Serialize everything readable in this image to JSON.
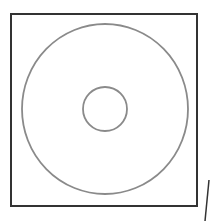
{
  "diagram": {
    "colors": {
      "square_stroke": "#333333",
      "circle_stroke": "#8a8a8a",
      "background": "#ffffff"
    },
    "square": {
      "x": 11,
      "y": 14,
      "width": 186,
      "height": 192
    },
    "outer_circle": {
      "cx": 105,
      "cy": 109,
      "rx": 83,
      "ry": 85
    },
    "inner_circle": {
      "cx": 105,
      "cy": 109,
      "r": 22
    },
    "stray_stroke": {
      "x1": 209,
      "y1": 180,
      "x2": 205,
      "y2": 221
    }
  }
}
